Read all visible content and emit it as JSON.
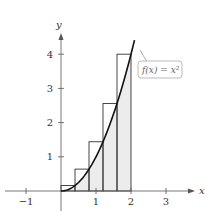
{
  "chart_data": {
    "type": "bar",
    "title": "",
    "xlabel": "x",
    "ylabel": "y",
    "xlim": [
      -1.5,
      3.5
    ],
    "ylim": [
      0,
      4.6
    ],
    "x_ticks": [
      "-1",
      "1",
      "2",
      "3"
    ],
    "y_ticks": [
      "1",
      "2",
      "3",
      "4"
    ],
    "grid": false,
    "function_label": "f(x) = x²",
    "function": "x^2",
    "curve_domain": [
      0,
      2.1
    ],
    "rectangles": {
      "method": "right-endpoint upper sum",
      "width": 0.4,
      "left_edges": [
        0,
        0.4,
        0.8,
        1.2,
        1.6
      ],
      "heights": [
        0.16,
        0.64,
        1.44,
        2.56,
        4
      ]
    },
    "shaded_region": "area under f(x)=x^2 from 0 to 2"
  },
  "labels": {
    "x_axis": "x",
    "y_axis": "y",
    "callout": "f(x) = x²",
    "ticks_x": [
      "−1",
      "1",
      "2",
      "3"
    ],
    "ticks_y": [
      "1",
      "2",
      "3",
      "4"
    ]
  }
}
